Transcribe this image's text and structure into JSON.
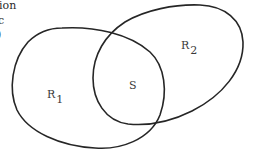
{
  "clipped_text": {
    "lines": [
      "ion",
      "c",
      ")"
    ]
  },
  "diagram": {
    "type": "venn",
    "regions": [
      {
        "id": "R1",
        "label": "R",
        "subscript": "1"
      },
      {
        "id": "R2",
        "label": "R",
        "subscript": "2"
      }
    ],
    "intersection": {
      "label": "S"
    },
    "stroke_color": "#262626",
    "background": "#ffffff"
  }
}
